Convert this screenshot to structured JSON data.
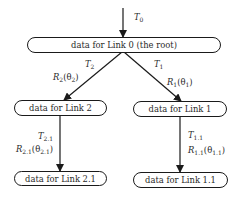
{
  "diagram": {
    "nodes": {
      "root": {
        "label": "data for Link 0 (the root)"
      },
      "link2": {
        "label": "data for Link 2"
      },
      "link1": {
        "label": "data for Link 1"
      },
      "link21": {
        "label": "data for Link 2.1"
      },
      "link11": {
        "label": "data for Link 1.1"
      }
    },
    "edges": {
      "input": {
        "t_symbol": "T",
        "t_sub": "0"
      },
      "root_to_link2": {
        "t_symbol": "T",
        "t_sub": "2",
        "r_symbol": "R",
        "r_sub": "2",
        "theta": "θ",
        "theta_sub": "2"
      },
      "root_to_link1": {
        "t_symbol": "T",
        "t_sub": "1",
        "r_symbol": "R",
        "r_sub": "1",
        "theta": "θ",
        "theta_sub": "1"
      },
      "link2_to_link21": {
        "t_symbol": "T",
        "t_sub": "2.1",
        "r_symbol": "R",
        "r_sub": "2.1",
        "theta": "θ",
        "theta_sub": "2.1"
      },
      "link1_to_link11": {
        "t_symbol": "T",
        "t_sub": "1.1",
        "r_symbol": "R",
        "r_sub": "1.1",
        "theta": "θ",
        "theta_sub": "1.1"
      }
    },
    "colors": {
      "line": "#1a1a1a",
      "text": "#2a2a2a",
      "background": "#ffffff"
    }
  }
}
